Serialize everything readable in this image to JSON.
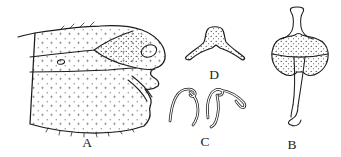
{
  "colors": {
    "background": "#ffffff",
    "ink": "#1c1c1c",
    "stipple": "#2f2f2f"
  },
  "panels": [
    {
      "label": "A"
    },
    {
      "label": "B"
    },
    {
      "label": "C"
    },
    {
      "label": "D"
    }
  ]
}
